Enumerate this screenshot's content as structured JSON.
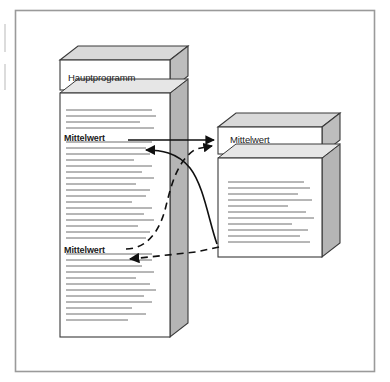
{
  "figure": {
    "kind": "call-flow-diagram",
    "language": "de",
    "background_color": "#ffffff",
    "frame": {
      "name": "outer-border",
      "color": "#9a9a9a",
      "x": 15,
      "y": 10,
      "width": 360,
      "height": 362
    },
    "edge_marks": {
      "color": "#d8d8d8",
      "marks": [
        {
          "x": 4,
          "y": 24,
          "width": 2,
          "height": 28
        },
        {
          "x": 4,
          "y": 64,
          "width": 2,
          "height": 26
        }
      ]
    }
  },
  "boxes": {
    "main_program": {
      "name": "main-program-box",
      "title": "Hauptprogramm",
      "face_color": "#ffffff",
      "top_color": "#d9d9d9",
      "side_color": "#b5b5b5",
      "stroke": "#3a3a3a",
      "x": 60,
      "y": 60,
      "width": 110,
      "height": 277,
      "depth_x": 18,
      "depth_y": -14,
      "header_height": 30,
      "call_labels": [
        "Mittelwert",
        "Mittelwert"
      ]
    },
    "subroutine": {
      "name": "subroutine-box",
      "title": "Mittelwert",
      "face_color": "#ffffff",
      "top_color": "#d9d9d9",
      "side_color": "#b5b5b5",
      "stroke": "#3a3a3a",
      "x": 218,
      "y": 127,
      "width": 104,
      "height": 130,
      "depth_x": 18,
      "depth_y": -14,
      "header_height": 27
    }
  },
  "connectors": {
    "stroke": "#101010",
    "items": [
      {
        "name": "call-arrow-solid",
        "style": "solid",
        "from": "main-program call site 1",
        "to": "subroutine header",
        "direction": "right"
      },
      {
        "name": "return-arrow-solid-curve",
        "style": "solid",
        "from": "subroutine body bottom-left",
        "to": "main-program line below call site 1",
        "direction": "left"
      },
      {
        "name": "call-arrow-dashed",
        "style": "dashed",
        "from": "main-program call site 2",
        "to": "subroutine header",
        "direction": "right"
      },
      {
        "name": "return-arrow-dashed",
        "style": "dashed",
        "from": "subroutine body bottom-left",
        "to": "main-program line below call site 2",
        "direction": "left"
      }
    ]
  },
  "text_lines": {
    "color": "#5f5f5f",
    "main_program_body": [
      {
        "y": 110,
        "w": 86
      },
      {
        "y": 116,
        "w": 90
      },
      {
        "y": 122,
        "w": 74
      },
      {
        "y": 128,
        "w": 88
      },
      {
        "y": 148,
        "w": 80
      },
      {
        "y": 154,
        "w": 84
      },
      {
        "y": 160,
        "w": 68
      },
      {
        "y": 166,
        "w": 86
      },
      {
        "y": 172,
        "w": 76
      },
      {
        "y": 178,
        "w": 88
      },
      {
        "y": 184,
        "w": 70
      },
      {
        "y": 190,
        "w": 84
      },
      {
        "y": 196,
        "w": 80
      },
      {
        "y": 202,
        "w": 66
      },
      {
        "y": 208,
        "w": 86
      },
      {
        "y": 214,
        "w": 78
      },
      {
        "y": 220,
        "w": 88
      },
      {
        "y": 226,
        "w": 72
      },
      {
        "y": 232,
        "w": 84
      },
      {
        "y": 238,
        "w": 80
      },
      {
        "y": 260,
        "w": 86
      },
      {
        "y": 266,
        "w": 76
      },
      {
        "y": 272,
        "w": 88
      },
      {
        "y": 278,
        "w": 70
      },
      {
        "y": 284,
        "w": 84
      },
      {
        "y": 290,
        "w": 90
      },
      {
        "y": 296,
        "w": 78
      },
      {
        "y": 302,
        "w": 86
      },
      {
        "y": 308,
        "w": 66
      },
      {
        "y": 314,
        "w": 80
      },
      {
        "y": 320,
        "w": 62
      }
    ],
    "subroutine_body": [
      {
        "y": 182,
        "w": 76
      },
      {
        "y": 188,
        "w": 82
      },
      {
        "y": 194,
        "w": 70
      },
      {
        "y": 200,
        "w": 84
      },
      {
        "y": 206,
        "w": 60
      },
      {
        "y": 212,
        "w": 78
      },
      {
        "y": 218,
        "w": 86
      },
      {
        "y": 224,
        "w": 64
      },
      {
        "y": 230,
        "w": 80
      },
      {
        "y": 236,
        "w": 72
      },
      {
        "y": 242,
        "w": 82
      }
    ]
  }
}
